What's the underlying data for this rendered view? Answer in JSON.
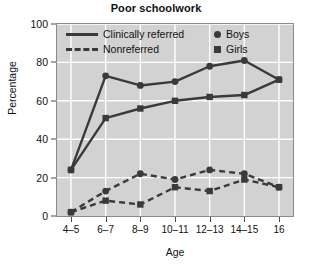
{
  "chart_data": {
    "type": "line",
    "title": "Poor schoolwork",
    "xlabel": "Age",
    "ylabel": "Percentage",
    "categories": [
      "4–5",
      "6–7",
      "8–9",
      "10–11",
      "12–13",
      "14–15",
      "16"
    ],
    "yticks": [
      0,
      20,
      40,
      60,
      80,
      100
    ],
    "ylim": [
      0,
      100
    ],
    "grid": true,
    "legend_position": "top-inside",
    "series": [
      {
        "name": "Clinically referred — Boys",
        "line_style": "solid",
        "marker": "circle",
        "color": "#3a3a3a",
        "values": [
          24,
          73,
          68,
          70,
          78,
          81,
          71
        ]
      },
      {
        "name": "Clinically referred — Girls",
        "line_style": "solid",
        "marker": "square",
        "color": "#3a3a3a",
        "values": [
          24,
          51,
          56,
          60,
          62,
          63,
          71
        ]
      },
      {
        "name": "Nonreferred — Boys",
        "line_style": "dashed",
        "marker": "circle",
        "color": "#3a3a3a",
        "values": [
          2,
          13,
          22,
          19,
          24,
          22,
          15
        ]
      },
      {
        "name": "Nonreferred — Girls",
        "line_style": "dashed",
        "marker": "square",
        "color": "#3a3a3a",
        "values": [
          2,
          8,
          6,
          15,
          13,
          19,
          15
        ]
      }
    ],
    "legend": {
      "line_entries": [
        {
          "label": "Clinically referred",
          "style": "solid"
        },
        {
          "label": "Nonreferred",
          "style": "dashed"
        }
      ],
      "marker_entries": [
        {
          "label": "Boys",
          "marker": "circle"
        },
        {
          "label": "Girls",
          "marker": "square"
        }
      ]
    },
    "colors": {
      "plot_background": "#d2d2d2",
      "gridline": "#ffffff",
      "series_ink": "#3a3a3a",
      "frame": "#8a8a8a",
      "text": "#111111"
    }
  }
}
